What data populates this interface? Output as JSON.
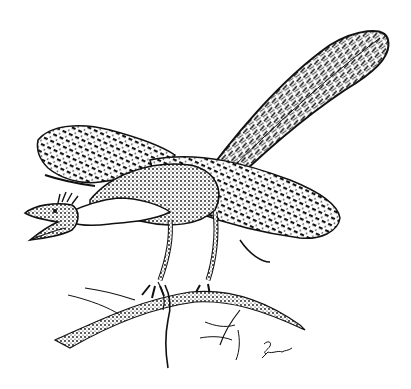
{
  "image": {
    "kind": "pen-and-ink illustration",
    "subject": "feathered dinosaur (Archaeopteryx-like) perched on a branch with a lizard in its claws",
    "width": 411,
    "height": 389,
    "background_color": "#ffffff",
    "ink_color": "#111111"
  },
  "elements": {
    "tail": {
      "label": "feathered tail"
    },
    "wing_raised": {
      "label": "raised left wing"
    },
    "wing_spread": {
      "label": "spread right wing"
    },
    "body": {
      "label": "body"
    },
    "head": {
      "label": "head with open beak and crest"
    },
    "legs": {
      "label": "legs"
    },
    "branch": {
      "label": "tree branch"
    },
    "lizard": {
      "label": "lizard prey"
    },
    "signature": {
      "label": "artist signature",
      "text": ""
    }
  }
}
